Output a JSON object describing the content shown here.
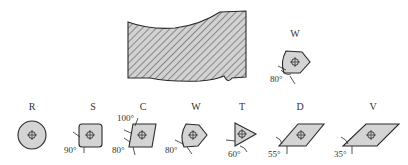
{
  "workpiece": {
    "fill": "#cfcfcf",
    "hatch": "#555555",
    "outline": "#2a2a2a"
  },
  "featured_insert": {
    "label": "W",
    "angle": "80°"
  },
  "inserts": [
    {
      "label": "R",
      "shape": "round",
      "angle": ""
    },
    {
      "label": "S",
      "shape": "square",
      "angle": "90°"
    },
    {
      "label": "C",
      "shape": "rhombic-80",
      "angle": "80°",
      "angle2": "100°"
    },
    {
      "label": "W",
      "shape": "trigon",
      "angle": "80°"
    },
    {
      "label": "T",
      "shape": "triangle",
      "angle": "60°"
    },
    {
      "label": "D",
      "shape": "rhombic-55",
      "angle": "55°"
    },
    {
      "label": "V",
      "shape": "rhombic-35",
      "angle": "35°"
    }
  ],
  "colors": {
    "insert_fill": "#d4d4d4",
    "line": "#2a2a2a",
    "background": "#ffffff"
  }
}
